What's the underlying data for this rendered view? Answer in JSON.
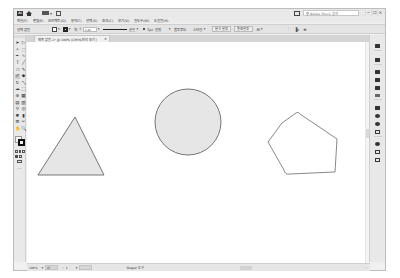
{
  "titlebar": {
    "app_logo": "Ai",
    "search_placeholder": "Adobe Stock 검색",
    "window_buttons": [
      "─",
      "❐",
      "✕"
    ]
  },
  "menubar": {
    "items": [
      "파일(F)",
      "편집(E)",
      "오브젝트(O)",
      "문자(T)",
      "선택(S)",
      "효과(C)",
      "보기(V)",
      "윈도우(W)",
      "도움말(H)"
    ]
  },
  "controlbar": {
    "selection_label": "선택 없음",
    "stroke_label": "획:",
    "stroke_weight": "1 pt",
    "stroke_profile_label": "균일",
    "brush_label": "5pt. 원형",
    "opacity_label": "불투명도:",
    "style_label": "스타일:",
    "doc_setup_button": "문서 설정",
    "preferences_button": "환경 설정"
  },
  "document_tab": {
    "title": "제목 없음-1* @ 100% (CMYK/미리 보기)",
    "close": "✕"
  },
  "toolbar": {
    "tools": [
      {
        "name": "selection-tool",
        "glyph": "➤"
      },
      {
        "name": "direct-selection-tool",
        "glyph": "▷"
      },
      {
        "name": "magic-wand-tool",
        "glyph": "✧"
      },
      {
        "name": "lasso-tool",
        "glyph": "◌"
      },
      {
        "name": "pen-tool",
        "glyph": "✒"
      },
      {
        "name": "curvature-tool",
        "glyph": "∿"
      },
      {
        "name": "type-tool",
        "glyph": "T"
      },
      {
        "name": "line-tool",
        "glyph": "╱"
      },
      {
        "name": "ellipse-tool",
        "glyph": "⬭"
      },
      {
        "name": "paintbrush-tool",
        "glyph": "✎"
      },
      {
        "name": "shaper-tool",
        "glyph": "✐"
      },
      {
        "name": "blob-brush-tool",
        "glyph": "◆"
      },
      {
        "name": "rotate-tool",
        "glyph": "↻"
      },
      {
        "name": "scale-tool",
        "glyph": "⤡"
      },
      {
        "name": "warp-tool",
        "glyph": "☁"
      },
      {
        "name": "free-transform-tool",
        "glyph": "⬚"
      },
      {
        "name": "shape-builder-tool",
        "glyph": "⊕"
      },
      {
        "name": "perspective-grid-tool",
        "glyph": "▦"
      },
      {
        "name": "mesh-tool",
        "glyph": "▤"
      },
      {
        "name": "gradient-tool",
        "glyph": "▥"
      },
      {
        "name": "eyedropper-tool",
        "glyph": "⚲"
      },
      {
        "name": "blend-tool",
        "glyph": "◎"
      },
      {
        "name": "symbol-sprayer-tool",
        "glyph": "✺"
      },
      {
        "name": "column-graph-tool",
        "glyph": "▮"
      },
      {
        "name": "artboard-tool",
        "glyph": "⊞"
      },
      {
        "name": "slice-tool",
        "glyph": "✂"
      },
      {
        "name": "hand-tool",
        "glyph": "✋"
      },
      {
        "name": "zoom-tool",
        "glyph": "🔍"
      }
    ],
    "more_tools": "···"
  },
  "dock": {
    "panels": [
      "properties",
      "layers",
      "libraries",
      "color",
      "swatches",
      "brushes",
      "symbols",
      "stroke",
      "gradient",
      "transparency",
      "appearance",
      "graphic-styles",
      "align",
      "pathfinder",
      "transform"
    ]
  },
  "canvas": {
    "shapes": [
      {
        "type": "triangle",
        "fill": "#e6e6e6",
        "stroke": "#555555"
      },
      {
        "type": "circle",
        "fill": "#e6e6e6",
        "stroke": "#555555"
      },
      {
        "type": "pentagon-freehand",
        "fill": "none",
        "stroke": "#555555"
      }
    ]
  },
  "statusbar": {
    "zoom": "100%",
    "rotation": "0°",
    "artboard_number": "1",
    "current_tool": "Shaper 도구"
  }
}
